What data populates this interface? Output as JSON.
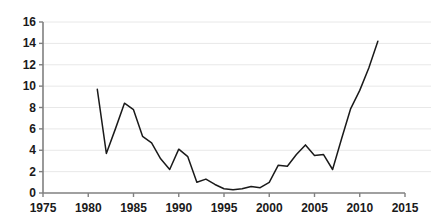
{
  "chart_data": {
    "type": "line",
    "title": "",
    "subtitle": "",
    "xlabel": "",
    "ylabel": "",
    "xlim": [
      1975,
      2015
    ],
    "ylim": [
      0,
      16
    ],
    "xticks": [
      1975,
      1980,
      1985,
      1990,
      1995,
      2000,
      2005,
      2010,
      2015
    ],
    "yticks": [
      0,
      2,
      4,
      6,
      8,
      10,
      12,
      14,
      16
    ],
    "xtick_labels": [
      "1975",
      "1980",
      "1985",
      "1990",
      "1995",
      "2000",
      "2005",
      "2010",
      "2015"
    ],
    "ytick_labels": [
      "0",
      "2",
      "4",
      "6",
      "8",
      "10",
      "12",
      "14",
      "16"
    ],
    "grid": "horizontal",
    "legend": "none",
    "line_color": "#1a1a1a",
    "grid_color": "#e8e8e8",
    "axis_color": "#808080",
    "background": "#ffffff",
    "series": [
      {
        "name": "value",
        "x": [
          1981,
          1982,
          1983,
          1984,
          1985,
          1986,
          1987,
          1988,
          1989,
          1990,
          1991,
          1992,
          1993,
          1994,
          1995,
          1996,
          1997,
          1998,
          1999,
          2000,
          2001,
          2002,
          2003,
          2004,
          2005,
          2006,
          2007,
          2008,
          2009,
          2010,
          2011,
          2012
        ],
        "values": [
          9.7,
          3.7,
          6.0,
          8.4,
          7.8,
          5.3,
          4.7,
          3.2,
          2.2,
          4.1,
          3.4,
          1.0,
          1.3,
          0.8,
          0.4,
          0.3,
          0.4,
          0.6,
          0.5,
          1.0,
          2.6,
          2.5,
          3.6,
          4.5,
          3.5,
          3.6,
          2.2,
          5.1,
          7.9,
          9.6,
          11.7,
          14.2
        ]
      }
    ]
  }
}
